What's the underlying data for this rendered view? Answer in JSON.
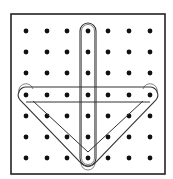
{
  "diagram": {
    "type": "geoboard",
    "grid": {
      "rows": 7,
      "cols": 7
    },
    "colors": {
      "background": "#ffffff",
      "border": "#222222",
      "peg": "#111111",
      "band": "#333333"
    },
    "bands": [
      {
        "name": "vertical-band",
        "pegs": [
          [
            4,
            1
          ],
          [
            4,
            7
          ]
        ]
      },
      {
        "name": "triangle-band",
        "pegs": [
          [
            1,
            4
          ],
          [
            7,
            4
          ],
          [
            4,
            7
          ]
        ]
      }
    ]
  }
}
